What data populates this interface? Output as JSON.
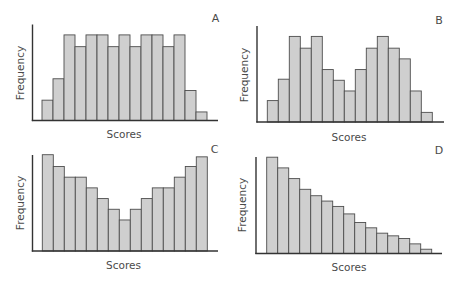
{
  "style": {
    "bar_fill": "#cfcfcf",
    "bar_stroke": "#4d4d4d",
    "axis_color": "#333333",
    "text_color": "#4a4a4a"
  },
  "chart_data": [
    {
      "id": "A",
      "type": "bar",
      "title": "A",
      "xlabel": "Scores",
      "ylabel": "Frequency",
      "grid": false,
      "legend": null,
      "description": "Roughly uniform (rectangular) distribution",
      "categories": [
        "1",
        "2",
        "3",
        "4",
        "5",
        "6",
        "7",
        "8",
        "9",
        "10",
        "11",
        "12",
        "13",
        "14",
        "15"
      ],
      "values": [
        1.9,
        3.9,
        8.0,
        6.9,
        8.0,
        8.0,
        6.9,
        8.0,
        6.9,
        8.0,
        8.0,
        6.9,
        8.0,
        2.8,
        0.8
      ],
      "ylim": [
        0,
        9
      ],
      "layout": {
        "axis_x": 32.5,
        "axis_top": 24.5,
        "baseline": 120.5,
        "axis_right": 218,
        "bar_left": 42,
        "bar_width": 11,
        "px_per_unit": 10.7,
        "label_pos": [
          215.5,
          22
        ],
        "xlabel_pos": [
          124,
          138
        ],
        "ylabel_pos": [
          21,
          73
        ]
      }
    },
    {
      "id": "B",
      "type": "bar",
      "title": "B",
      "xlabel": "Scores",
      "ylabel": "Frequency",
      "grid": false,
      "legend": null,
      "description": "Bimodal distribution",
      "categories": [
        "1",
        "2",
        "3",
        "4",
        "5",
        "6",
        "7",
        "8",
        "9",
        "10",
        "11",
        "12",
        "13",
        "14",
        "15"
      ],
      "values": [
        2.0,
        4.0,
        8.0,
        6.9,
        8.0,
        4.9,
        3.9,
        2.9,
        4.9,
        6.9,
        8.0,
        6.9,
        5.9,
        2.9,
        0.9
      ],
      "ylim": [
        0,
        9
      ],
      "layout": {
        "axis_x": 257,
        "axis_top": 26,
        "baseline": 122,
        "axis_right": 444,
        "bar_left": 267.3,
        "bar_width": 11,
        "px_per_unit": 10.7,
        "label_pos": [
          439,
          24
        ],
        "xlabel_pos": [
          349,
          141
        ],
        "ylabel_pos": [
          244.5,
          75
        ]
      }
    },
    {
      "id": "C",
      "type": "bar",
      "title": "C",
      "xlabel": "Scores",
      "ylabel": "Frequency",
      "grid": false,
      "legend": null,
      "description": "U-shaped distribution",
      "categories": [
        "1",
        "2",
        "3",
        "4",
        "5",
        "6",
        "7",
        "8",
        "9",
        "10",
        "11",
        "12",
        "13",
        "14",
        "15"
      ],
      "values": [
        9.0,
        7.9,
        6.9,
        6.9,
        5.9,
        4.9,
        3.9,
        2.9,
        3.9,
        4.9,
        5.9,
        5.9,
        6.9,
        7.9,
        8.8
      ],
      "ylim": [
        0,
        9
      ],
      "layout": {
        "axis_x": 32.5,
        "axis_top": 155,
        "baseline": 251,
        "axis_right": 218,
        "bar_left": 42.3,
        "bar_width": 11,
        "px_per_unit": 10.7,
        "label_pos": [
          214.5,
          152.5
        ],
        "xlabel_pos": [
          123.5,
          269
        ],
        "ylabel_pos": [
          21,
          203
        ]
      }
    },
    {
      "id": "D",
      "type": "bar",
      "title": "D",
      "xlabel": "Scores",
      "ylabel": "Frequency",
      "grid": false,
      "legend": null,
      "description": "Positively (right) skewed distribution",
      "categories": [
        "1",
        "2",
        "3",
        "4",
        "5",
        "6",
        "7",
        "8",
        "9",
        "10",
        "11",
        "12",
        "13",
        "14",
        "15"
      ],
      "values": [
        9.0,
        8.0,
        7.0,
        6.0,
        5.4,
        4.9,
        4.4,
        3.7,
        2.9,
        2.4,
        1.9,
        1.65,
        1.4,
        0.9,
        0.4
      ],
      "ylim": [
        0,
        9
      ],
      "layout": {
        "axis_x": 256,
        "axis_top": 157,
        "baseline": 253.5,
        "axis_right": 442,
        "bar_left": 266.7,
        "bar_width": 11,
        "px_per_unit": 10.7,
        "label_pos": [
          439,
          154
        ],
        "xlabel_pos": [
          349,
          271
        ],
        "ylabel_pos": [
          243,
          205
        ]
      }
    }
  ]
}
